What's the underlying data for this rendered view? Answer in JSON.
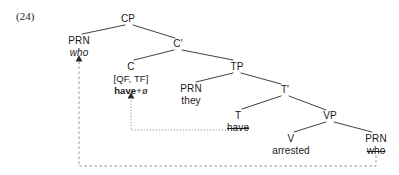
{
  "figure": {
    "example_number": "(24)",
    "type": "syntax-tree",
    "colors": {
      "branch": "#2b2b2b",
      "movement_dotted": "#8a8a8a",
      "movement_dashed": "#8a8a8a",
      "text": "#1a1a1a",
      "background": "#ffffff"
    }
  },
  "tree": {
    "nodes": [
      {
        "id": "cp",
        "label": "CP",
        "x": 128,
        "y": 19,
        "kind": "node"
      },
      {
        "id": "prn-spec",
        "label": "PRN",
        "x": 79,
        "y": 41,
        "kind": "node"
      },
      {
        "id": "cbar",
        "label": "C'",
        "x": 178,
        "y": 44,
        "kind": "node"
      },
      {
        "id": "c",
        "label": "C",
        "x": 131,
        "y": 67,
        "kind": "node"
      },
      {
        "id": "tp",
        "label": "TP",
        "x": 237,
        "y": 67,
        "kind": "node"
      },
      {
        "id": "prn-subj",
        "label": "PRN",
        "x": 191,
        "y": 89,
        "kind": "node"
      },
      {
        "id": "tbar",
        "label": "T'",
        "x": 285,
        "y": 90,
        "kind": "node"
      },
      {
        "id": "t",
        "label": "T",
        "x": 238,
        "y": 116,
        "kind": "node"
      },
      {
        "id": "vp",
        "label": "VP",
        "x": 330,
        "y": 116,
        "kind": "node"
      },
      {
        "id": "v",
        "label": "V",
        "x": 291,
        "y": 139,
        "kind": "node"
      },
      {
        "id": "prn-obj",
        "label": "PRN",
        "x": 376,
        "y": 139,
        "kind": "node"
      }
    ],
    "terminals": [
      {
        "id": "who-spec",
        "text": "who",
        "x": 79,
        "y": 53,
        "style": "italic"
      },
      {
        "id": "c-features",
        "text": "[QF, TF]",
        "x": 131,
        "y": 79,
        "style": "plain"
      },
      {
        "id": "they",
        "text": "they",
        "x": 191,
        "y": 101,
        "style": "plain"
      },
      {
        "id": "have-t",
        "text": "have",
        "x": 238,
        "y": 128,
        "style": "strikethrough"
      },
      {
        "id": "arrested",
        "text": "arrested",
        "x": 291,
        "y": 151,
        "style": "plain"
      },
      {
        "id": "who-obj",
        "text": "who",
        "x": 376,
        "y": 151,
        "style": "strikethrough"
      }
    ],
    "complex_head": {
      "id": "have-plus-zero",
      "x": 131,
      "y": 91,
      "bold_part": "have",
      "affix_part": "+ø"
    },
    "branches": [
      {
        "from": "cp",
        "to": "prn-spec",
        "x1": 125,
        "y1": 25,
        "x2": 82,
        "y2": 34
      },
      {
        "from": "cp",
        "to": "cbar",
        "x1": 133,
        "y1": 25,
        "x2": 175,
        "y2": 38
      },
      {
        "from": "cbar",
        "to": "c",
        "x1": 174,
        "y1": 50,
        "x2": 134,
        "y2": 60
      },
      {
        "from": "cbar",
        "to": "tp",
        "x1": 182,
        "y1": 50,
        "x2": 233,
        "y2": 60
      },
      {
        "from": "tp",
        "to": "prn-subj",
        "x1": 233,
        "y1": 73,
        "x2": 196,
        "y2": 82
      },
      {
        "from": "tp",
        "to": "tbar",
        "x1": 241,
        "y1": 73,
        "x2": 281,
        "y2": 84
      },
      {
        "from": "tbar",
        "to": "t",
        "x1": 281,
        "y1": 96,
        "x2": 242,
        "y2": 109
      },
      {
        "from": "tbar",
        "to": "vp",
        "x1": 289,
        "y1": 96,
        "x2": 326,
        "y2": 110
      },
      {
        "from": "vp",
        "to": "v",
        "x1": 326,
        "y1": 122,
        "x2": 294,
        "y2": 132
      },
      {
        "from": "vp",
        "to": "prn-obj",
        "x1": 334,
        "y1": 122,
        "x2": 372,
        "y2": 132
      }
    ],
    "movements": [
      {
        "id": "head-movement-have",
        "style": "dotted",
        "label": "T-to-C head movement of have",
        "path": "M 226 130 L 131 130 L 131 99",
        "arrow_x": 131,
        "arrow_y": 94
      },
      {
        "id": "phrasal-movement-who",
        "style": "dashed",
        "label": "wh-movement of who to spec-CP",
        "path": "M 376 155 L 376 166 L 79 166 L 79 60",
        "arrow_x": 79,
        "arrow_y": 56
      }
    ]
  }
}
